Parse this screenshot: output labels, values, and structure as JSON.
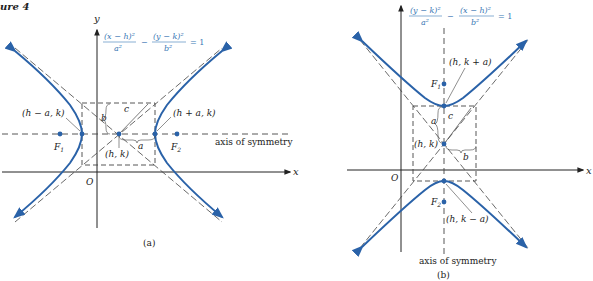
{
  "figure_label": "ure 4",
  "colors": {
    "curve": "#2a62a8",
    "axis": "#222222",
    "equation": "#3a78b5",
    "dash": "#444444"
  },
  "panel_a": {
    "caption": "(a)",
    "equation": {
      "num1": "(x − h)²",
      "den1": "a²",
      "minus": "−",
      "num2": "(y − k)²",
      "den2": "b²",
      "rhs": "= 1"
    },
    "axis_y": "y",
    "axis_x": "x",
    "origin": "O",
    "vertex_left": "(h − a, k)",
    "vertex_right": "(h + a, k)",
    "center": "(h, k)",
    "focus1": "F",
    "focus1_sub": "1",
    "focus2": "F",
    "focus2_sub": "2",
    "label_a": "a",
    "label_b": "b",
    "label_c": "c",
    "axis_of_symmetry": "axis of symmetry"
  },
  "panel_b": {
    "caption": "(b)",
    "equation": {
      "num1": "(y − k)²",
      "den1": "a²",
      "minus": "−",
      "num2": "(x − h)²",
      "den2": "b²",
      "rhs": "= 1"
    },
    "axis_x": "x",
    "origin": "O",
    "vertex_top": "(h, k + a)",
    "vertex_bottom": "(h, k − a)",
    "center": "(h, k)",
    "focus1": "F",
    "focus1_sub": "1",
    "focus2": "F",
    "focus2_sub": "2",
    "label_a": "a",
    "label_b": "b",
    "label_c": "c",
    "axis_of_symmetry": "axis of symmetry"
  }
}
